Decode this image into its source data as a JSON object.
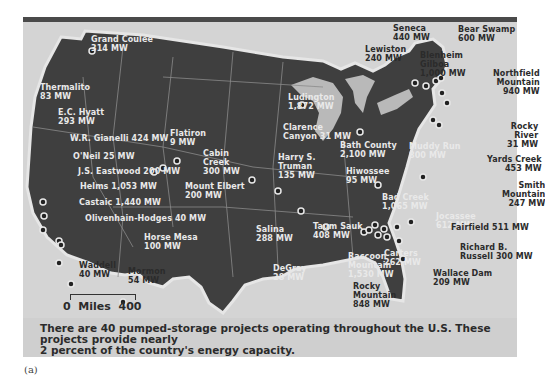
{
  "figure": {
    "panel_label": "(a)",
    "caption_line1": "There are 40 pumped-storage projects operating throughout the U.S. These projects provide nearly",
    "caption_line2": "2 percent of the country's energy capacity.",
    "scale": {
      "start": "0",
      "unit": "Miles",
      "end": "400"
    }
  },
  "colors": {
    "land": "#3f3f3f",
    "water": "#d4d4d4",
    "lakes": "#b9b9b9",
    "borders": "#8a8a8a",
    "label_on_land": "#e9e9e9",
    "label_on_water": "#2b2b2b"
  },
  "projects": [
    {
      "name": "Grand Coulee",
      "capacity": "314 MW"
    },
    {
      "name": "Thermalito",
      "capacity": "83 MW"
    },
    {
      "name": "E.C. Hyatt",
      "capacity": "293 MW"
    },
    {
      "name": "W.R. Gianelli",
      "capacity": "424 MW"
    },
    {
      "name": "O'Neil",
      "capacity": "25 MW"
    },
    {
      "name": "J.S. Eastwood",
      "capacity": "200 MW"
    },
    {
      "name": "Helms",
      "capacity": "1,053 MW"
    },
    {
      "name": "Castaic",
      "capacity": "1,440 MW"
    },
    {
      "name": "Olivenhain-Hodges",
      "capacity": "40 MW"
    },
    {
      "name": "Waddell",
      "capacity": "40 MW"
    },
    {
      "name": "Horse Mesa",
      "capacity": "100 MW"
    },
    {
      "name": "Mormon Flat",
      "capacity": "54 MW"
    },
    {
      "name": "Flatiron",
      "capacity": "9 MW"
    },
    {
      "name": "Cabin Creek",
      "capacity": "300 MW"
    },
    {
      "name": "Mount Elbert",
      "capacity": "200 MW"
    },
    {
      "name": "Ludington",
      "capacity": "1,872 MW"
    },
    {
      "name": "Clarence Canyon",
      "capacity": "31 MW"
    },
    {
      "name": "Harry S. Truman",
      "capacity": "135 MW"
    },
    {
      "name": "Salina",
      "capacity": "288 MW"
    },
    {
      "name": "Taum Sauk",
      "capacity": "408 MW"
    },
    {
      "name": "DeGray",
      "capacity": "28 MW"
    },
    {
      "name": "Bath County",
      "capacity": "2,100 MW"
    },
    {
      "name": "Hiwossee",
      "capacity": "95 MW"
    },
    {
      "name": "Raccoon Mountain",
      "capacity": "1,530 MW"
    },
    {
      "name": "Bad Creek",
      "capacity": "1,065 MW"
    },
    {
      "name": "Jocassee",
      "capacity": "612 MW"
    },
    {
      "name": "Carters",
      "capacity": "262 MW"
    },
    {
      "name": "Rocky Mountain",
      "capacity": "848 MW"
    },
    {
      "name": "Seneca",
      "capacity": "440 MW"
    },
    {
      "name": "Lewiston",
      "capacity": "240 MW"
    },
    {
      "name": "Blenheim Gilboa",
      "capacity": "1,000 MW"
    },
    {
      "name": "Bear Swamp",
      "capacity": "600 MW"
    },
    {
      "name": "Northfield Mountain",
      "capacity": "940 MW"
    },
    {
      "name": "Rocky River",
      "capacity": "31 MW"
    },
    {
      "name": "Muddy Run",
      "capacity": "800 MW"
    },
    {
      "name": "Yards Creek",
      "capacity": "453 MW"
    },
    {
      "name": "Smith Mountain",
      "capacity": "247 MW"
    },
    {
      "name": "Fairfield",
      "capacity": "511 MW"
    },
    {
      "name": "Richard B. Russell",
      "capacity": "300 MW"
    },
    {
      "name": "Wallace Dam",
      "capacity": "209 MW"
    }
  ]
}
